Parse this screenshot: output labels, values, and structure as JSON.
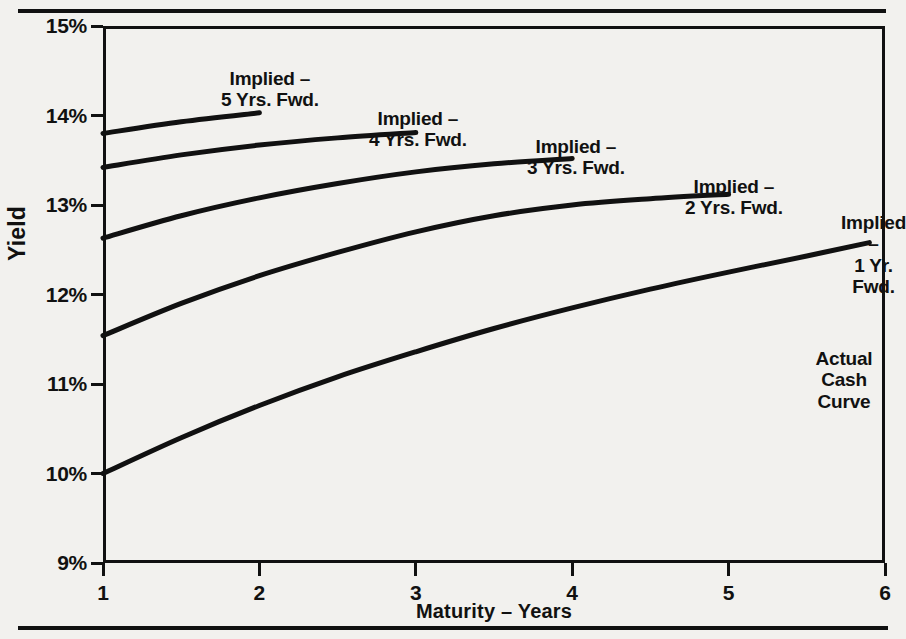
{
  "figure": {
    "title_partial": "",
    "axes": {
      "ylabel": "Yield",
      "xlabel": "Maturity – Years",
      "yticks": [
        "9%",
        "10%",
        "11%",
        "12%",
        "13%",
        "14%",
        "15%"
      ],
      "xticks": [
        "1",
        "2",
        "3",
        "4",
        "5",
        "6"
      ]
    },
    "annotations": [
      {
        "name": "implied-5-yrs-fwd",
        "text": "Implied –\n5 Yrs. Fwd.",
        "left": 118,
        "top": 42
      },
      {
        "name": "implied-4-yrs-fwd",
        "text": "Implied –\n4 Yrs. Fwd.",
        "left": 266,
        "top": 82
      },
      {
        "name": "implied-3-yrs-fwd",
        "text": "Implied –\n3 Yrs. Fwd.",
        "left": 424,
        "top": 110
      },
      {
        "name": "implied-2-yrs-fwd",
        "text": "Implied –\n2 Yrs. Fwd.",
        "left": 582,
        "top": 150
      },
      {
        "name": "implied-1-yr-fwd",
        "text": "Implied –\n1 Yr. Fwd.",
        "left": 738,
        "top": 186
      },
      {
        "name": "actual-cash-curve",
        "text": "Actual Cash\nCurve",
        "left": 700,
        "top": 322
      }
    ]
  },
  "chart_data": {
    "type": "line",
    "title": "",
    "xlabel": "Maturity – Years",
    "ylabel": "Yield",
    "xlim": [
      1,
      6
    ],
    "ylim": [
      9,
      15
    ],
    "ytick_values": [
      9,
      10,
      11,
      12,
      13,
      14,
      15
    ],
    "ytick_labels": [
      "9%",
      "10%",
      "11%",
      "12%",
      "13%",
      "14%",
      "15%"
    ],
    "xtick_values": [
      1,
      2,
      3,
      4,
      5,
      6
    ],
    "xtick_labels": [
      "1",
      "2",
      "3",
      "4",
      "5",
      "6"
    ],
    "grid": false,
    "legend": "inline-annotations",
    "units": "percent",
    "series": [
      {
        "name": "Actual Cash Curve",
        "x": [
          1.0,
          1.5,
          2.0,
          2.5,
          3.0,
          3.5,
          4.0,
          4.5,
          5.0,
          5.5,
          5.9
        ],
        "values": [
          10.0,
          10.4,
          10.76,
          11.08,
          11.36,
          11.62,
          11.85,
          12.06,
          12.25,
          12.43,
          12.58
        ]
      },
      {
        "name": "Implied – 1 Yr. Fwd.",
        "x": [
          1.0,
          1.5,
          2.0,
          2.5,
          3.0,
          3.5,
          4.0,
          4.5,
          5.0
        ],
        "values": [
          11.54,
          11.9,
          12.21,
          12.47,
          12.7,
          12.88,
          13.0,
          13.07,
          13.12
        ]
      },
      {
        "name": "Implied – 2 Yrs. Fwd.",
        "x": [
          1.0,
          1.5,
          2.0,
          2.5,
          3.0,
          3.5,
          4.0
        ],
        "values": [
          12.63,
          12.88,
          13.08,
          13.24,
          13.37,
          13.46,
          13.52
        ]
      },
      {
        "name": "Implied – 3 Yrs. Fwd.",
        "x": [
          1.0,
          1.5,
          2.0,
          2.5,
          3.0
        ],
        "values": [
          13.42,
          13.56,
          13.67,
          13.75,
          13.81
        ]
      },
      {
        "name": "Implied – 4 Yrs. Fwd.",
        "x": [
          1.0,
          1.5,
          2.0
        ],
        "values": [
          13.8,
          13.93,
          14.03
        ]
      }
    ]
  }
}
